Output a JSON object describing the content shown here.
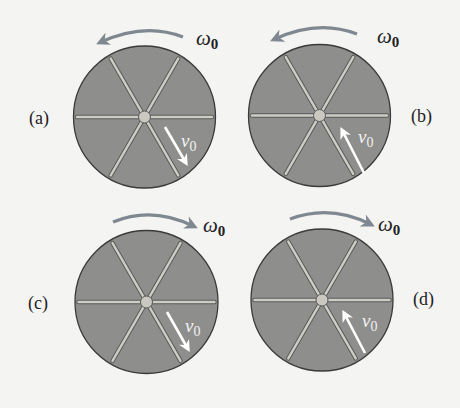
{
  "figure": {
    "colors": {
      "background": "#f4f4f2",
      "disc_fill": "#8e8e8c",
      "disc_stroke": "#3a3a3a",
      "spoke_fill": "#cdcdc6",
      "spoke_stroke": "#5a5a58",
      "hub_fill": "#c9c9c2",
      "rotation_arrow": "#7f8890",
      "velocity_arrow": "#ffffff",
      "text": "#222222"
    },
    "panels": [
      {
        "id": "a",
        "label": "(a)",
        "rotation": "counterclockwise",
        "omega_symbol": "ω",
        "omega_subscript": "0",
        "velocity_symbol": "v",
        "velocity_subscript": "0",
        "velocity_direction": "outward"
      },
      {
        "id": "b",
        "label": "(b)",
        "rotation": "counterclockwise",
        "omega_symbol": "ω",
        "omega_subscript": "0",
        "velocity_symbol": "v",
        "velocity_subscript": "0",
        "velocity_direction": "inward"
      },
      {
        "id": "c",
        "label": "(c)",
        "rotation": "clockwise",
        "omega_symbol": "ω",
        "omega_subscript": "0",
        "velocity_symbol": "v",
        "velocity_subscript": "0",
        "velocity_direction": "outward"
      },
      {
        "id": "d",
        "label": "(d)",
        "rotation": "clockwise",
        "omega_symbol": "ω",
        "omega_subscript": "0",
        "velocity_symbol": "v",
        "velocity_subscript": "0",
        "velocity_direction": "inward"
      }
    ]
  }
}
